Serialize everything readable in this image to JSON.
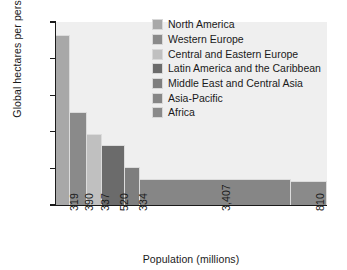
{
  "chart_data": {
    "type": "bar",
    "variant": "variable-width-marimekko",
    "title": "",
    "xlabel": "Population (millions)",
    "ylabel": "Global hectares per person",
    "ylim": [
      0,
      10
    ],
    "yticks": [
      0,
      2,
      4,
      6,
      8,
      10
    ],
    "ytick_labels": [
      "0",
      "2",
      "4",
      "6",
      "8",
      "10"
    ],
    "grid": false,
    "legend_position": "inside-upper-right",
    "categories": [
      "North America",
      "Western Europe",
      "Central and Eastern Europe",
      "Latin America and the Caribbean",
      "Middle East and Central Asia",
      "Asia-Pacific",
      "Africa"
    ],
    "xtick_labels": [
      "319",
      "390",
      "337",
      "520",
      "334",
      "3,407",
      "810"
    ],
    "widths_population_millions": [
      319,
      390,
      337,
      520,
      334,
      3407,
      810
    ],
    "values": [
      9.27,
      5.08,
      3.88,
      3.28,
      2.08,
      1.42,
      1.31
    ],
    "colors": [
      "#a8a8a8",
      "#8a8a8a",
      "#c0c0c0",
      "#6b6b6b",
      "#7e7e7e",
      "#868686",
      "#8a8a8a"
    ],
    "plot_background": "#efefef",
    "axis_color": "#1a1a1a"
  },
  "legend": {
    "items": [
      {
        "label": "North America",
        "color": "#a8a8a8"
      },
      {
        "label": "Western Europe",
        "color": "#8a8a8a"
      },
      {
        "label": "Central and Eastern Europe",
        "color": "#c0c0c0"
      },
      {
        "label": "Latin America and the Caribbean",
        "color": "#6b6b6b"
      },
      {
        "label": "Middle East and Central Asia",
        "color": "#7e7e7e"
      },
      {
        "label": "Asia-Pacific",
        "color": "#868686"
      },
      {
        "label": "Africa",
        "color": "#8a8a8a"
      }
    ]
  }
}
